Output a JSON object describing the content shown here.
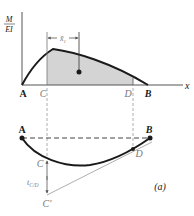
{
  "figure": {
    "label": "(a)"
  },
  "moment_diagram": {
    "y_axis_label_num": "M",
    "y_axis_label_den": "EI",
    "x_axis_label": "x",
    "points": {
      "A": "A",
      "C": "C",
      "D": "D",
      "B": "B"
    },
    "centroid_dim_label": "x̄",
    "centroid_dim_sub": "1",
    "colors": {
      "shaded_area": "#d4d4d4",
      "curve": "#1a1a1a",
      "axis": "#555555"
    }
  },
  "deflection_diagram": {
    "points": {
      "A": "A",
      "B": "B",
      "C": "C",
      "C_prime": "C'",
      "D": "D"
    },
    "deviation_label": "t",
    "deviation_sub": "C/D"
  }
}
